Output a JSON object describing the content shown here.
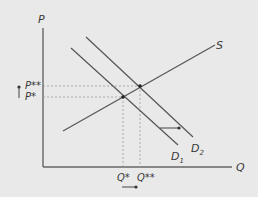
{
  "diagram": {
    "colors": {
      "background": "#e9e9e9",
      "line": "#555555",
      "guide": "#9a9a9a",
      "text": "#3a3a3a"
    },
    "axes": {
      "y_label": "P",
      "x_label": "Q"
    },
    "curves": {
      "supply": "S",
      "demand_initial_main": "D",
      "demand_initial_sub": "1",
      "demand_new_main": "D",
      "demand_new_sub": "2"
    },
    "price_labels": {
      "new": "P**",
      "initial": "P*"
    },
    "quantity_labels": {
      "initial": "Q*",
      "new": "Q**"
    },
    "shifts": {
      "demand": "rightward",
      "price": "up",
      "quantity": "right"
    }
  }
}
